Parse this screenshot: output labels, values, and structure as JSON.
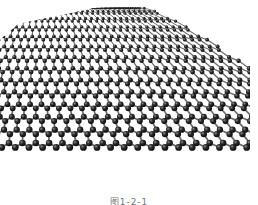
{
  "figure": {
    "caption": "图1-2-1"
  },
  "colors": {
    "background": "#ffffff",
    "bond": "#6e6e6e",
    "atom": "#1a1a1a",
    "atom_highlight": "#8a8a8a",
    "caption": "#777777"
  }
}
